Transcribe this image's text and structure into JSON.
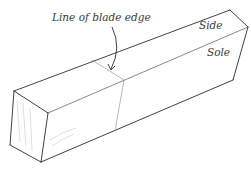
{
  "diagram": {
    "labels": {
      "blade_edge": "Line of blade edge",
      "side": "Side",
      "sole": "Sole"
    },
    "colors": {
      "line": "#2b2b2b",
      "light_line": "#9a9a9a",
      "text": "#3a3a3a",
      "background": "#ffffff"
    }
  }
}
